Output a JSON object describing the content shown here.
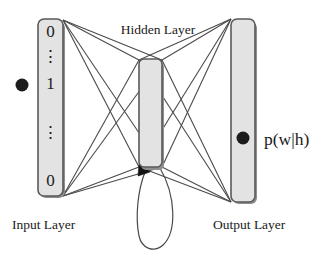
{
  "diagram": {
    "background_color": "#ffffff",
    "line_color": "#4a4a4a",
    "box_fill_color": "#e3e3e3",
    "box_stroke_color": "#5a5a5a",
    "dot_color": "#1c1c1c"
  },
  "input_layer": {
    "label": "Input Layer",
    "cells": [
      {
        "value": "0"
      },
      {
        "value": "⋮"
      },
      {
        "value": "1"
      },
      {
        "value": "⋮"
      },
      {
        "value": "0"
      }
    ],
    "marker_dot": "input-node-dot"
  },
  "hidden_layer": {
    "label": "Hidden Layer",
    "recurrent_loop": "self-recurrent-connection",
    "arrow": "recurrent-arrowhead"
  },
  "output_layer": {
    "label": "Output Layer",
    "expression": "p(w|h)",
    "marker_dot": "output-node-dot"
  },
  "connections": {
    "input_to_hidden": "fully-connected",
    "hidden_to_output": "fully-connected"
  }
}
